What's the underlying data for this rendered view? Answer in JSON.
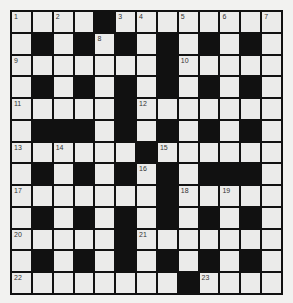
{
  "puzzle": {
    "rows": 13,
    "cols": 13,
    "colors": {
      "white_cell": "#ebebea",
      "black_cell": "#111111",
      "border": "#111111",
      "background": "#f2f2f0",
      "number": "#333333"
    },
    "grid": [
      "WWWWBWWWWWWWW",
      "WBWBWBWBWBWBW",
      "WWWWWWWBWWWWW",
      "WBWBWBWBWBWBW",
      "WWWWWBWWWWWWW",
      "WBBBWBWBWBWBW",
      "WWWWWWBWWWWWW",
      "WBWBWBWBWBBBW",
      "WWWWWWWBWWWWW",
      "WBWBWBWBWBWBW",
      "WWWWWBWWWWWWW",
      "WBWBWBWBWBWBW",
      "WWWWWWWWBWWWW"
    ],
    "numbers": [
      {
        "row": 0,
        "col": 0,
        "n": "1"
      },
      {
        "row": 0,
        "col": 2,
        "n": "2"
      },
      {
        "row": 0,
        "col": 5,
        "n": "3"
      },
      {
        "row": 0,
        "col": 6,
        "n": "4"
      },
      {
        "row": 0,
        "col": 8,
        "n": "5"
      },
      {
        "row": 0,
        "col": 10,
        "n": "6"
      },
      {
        "row": 0,
        "col": 12,
        "n": "7"
      },
      {
        "row": 1,
        "col": 4,
        "n": "8"
      },
      {
        "row": 2,
        "col": 0,
        "n": "9"
      },
      {
        "row": 2,
        "col": 8,
        "n": "10"
      },
      {
        "row": 4,
        "col": 0,
        "n": "11"
      },
      {
        "row": 4,
        "col": 6,
        "n": "12"
      },
      {
        "row": 6,
        "col": 0,
        "n": "13"
      },
      {
        "row": 6,
        "col": 2,
        "n": "14"
      },
      {
        "row": 6,
        "col": 7,
        "n": "15"
      },
      {
        "row": 7,
        "col": 6,
        "n": "16"
      },
      {
        "row": 8,
        "col": 0,
        "n": "17"
      },
      {
        "row": 8,
        "col": 8,
        "n": "18"
      },
      {
        "row": 8,
        "col": 10,
        "n": "19"
      },
      {
        "row": 10,
        "col": 0,
        "n": "20"
      },
      {
        "row": 10,
        "col": 6,
        "n": "21"
      },
      {
        "row": 12,
        "col": 0,
        "n": "22"
      },
      {
        "row": 12,
        "col": 9,
        "n": "23"
      }
    ]
  }
}
